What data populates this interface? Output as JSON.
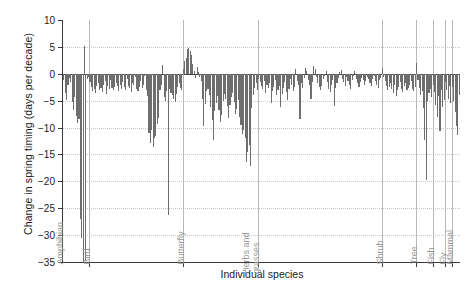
{
  "chart_data": {
    "type": "bar",
    "title": "",
    "xlabel": "Individual species",
    "ylabel": "Change in spring timing (days per decade)",
    "ylim": [
      -35,
      10
    ],
    "yticks": [
      10,
      5,
      0,
      -5,
      -10,
      -15,
      -20,
      -25,
      -30,
      -35
    ],
    "ytick_labels": [
      "10",
      "5",
      "0",
      "−5",
      "−10",
      "−15",
      "−20",
      "−25",
      "−30",
      "−35"
    ],
    "grid": "horizontal-dotted",
    "legend": "none",
    "bar_color": "#6e6e6e",
    "groups": [
      {
        "label": "Amphibian",
        "values": [
          -0.4,
          -1.2,
          -3.6,
          -4.8,
          -2.0,
          -0.8,
          -1.6,
          -5.2,
          -6.8,
          -4.4,
          -7.8,
          -9.2,
          -8.4,
          -27.0,
          -30.5,
          -35.0,
          5.2,
          -34.8,
          -1.0,
          -0.6
        ]
      },
      {
        "label": "Bird",
        "values": [
          -1.6,
          -2.4,
          -3.2,
          -2.8,
          -3.6,
          -2.2,
          -1.8,
          -3.0,
          -2.6,
          -3.4,
          -2.0,
          -1.4,
          -3.8,
          -2.2,
          -2.8,
          -1.2,
          -2.6,
          -3.0,
          -2.4,
          -1.8,
          -2.2,
          -3.2,
          -2.0,
          -2.8,
          -1.6,
          -2.4,
          -3.0,
          -1.0,
          -2.2,
          -2.6,
          -3.4,
          -1.8,
          -2.0,
          -0.6,
          -2.8,
          -3.2,
          -2.4,
          -1.4,
          -2.6,
          -2.0,
          -0.4,
          -3.0,
          -4.2,
          -11.0,
          -12.8,
          -10.4,
          -13.6,
          -12.0,
          -11.6,
          -9.4,
          -8.2,
          -3.0,
          -2.0,
          1.6,
          -4.4,
          -5.0,
          -3.2,
          -26.2,
          -2.8,
          -3.6,
          -4.0,
          -4.6,
          -5.2,
          -3.8,
          -2.4,
          -1.8,
          -2.6,
          -3.0
        ]
      },
      {
        "label": "Butterfly",
        "values": [
          0.8,
          2.4,
          3.0,
          4.6,
          4.8,
          4.2,
          3.4,
          1.8,
          0.6,
          -0.8,
          1.2,
          0.4,
          -0.6,
          -1.4,
          -4.6,
          -9.8,
          -5.6,
          -3.2,
          -2.8,
          -4.0,
          -6.2,
          -8.6,
          -12.4,
          -7.0,
          -5.4,
          -4.2,
          -6.8,
          -9.0,
          -7.6,
          -5.0,
          -3.8,
          -4.6,
          -6.0,
          -8.2,
          -5.8,
          -4.4,
          -3.6,
          -5.2,
          -7.4,
          -6.6,
          -4.8,
          -8.0,
          -9.6,
          -11.2,
          -10.4,
          -12.0,
          -16.4,
          -14.6,
          -13.2,
          -17.2,
          -6.4,
          -4.0,
          -2.6,
          -1.8,
          -3.0
        ]
      },
      {
        "label": "Herbs and grasses",
        "values": [
          -1.0,
          -1.6,
          -2.2,
          -2.8,
          -1.4,
          -3.6,
          -2.0,
          -2.6,
          -1.8,
          -5.4,
          -3.2,
          -2.4,
          -1.2,
          -4.0,
          -3.0,
          -2.2,
          -6.2,
          -3.8,
          -2.6,
          -1.6,
          -3.4,
          -4.8,
          -2.8,
          -1.0,
          -2.0,
          -3.2,
          -2.4,
          0.8,
          -1.4,
          -2.0,
          -8.4,
          -1.8,
          -2.6,
          -0.8,
          1.0,
          0.6,
          -1.2,
          -2.0,
          -4.6,
          -1.6,
          1.4,
          0.9,
          -0.6,
          -1.8,
          -2.4,
          -3.0,
          -2.2,
          -1.0,
          -0.4,
          0.5,
          -1.6,
          -2.8,
          -3.4,
          -2.0,
          -1.2,
          -6.0,
          -2.6,
          -1.8,
          -0.8,
          0.4,
          0.7,
          -1.0,
          -1.6,
          -2.2,
          -0.6,
          -1.4,
          -2.0,
          -2.8,
          -1.2,
          -0.5,
          0.6,
          -1.0,
          -1.8,
          -2.4,
          -1.6,
          -0.8,
          -1.2,
          -2.0,
          -1.4,
          -0.6,
          -1.0,
          -1.8,
          -2.2,
          -1.0,
          -0.4,
          -1.4,
          -2.0,
          -2.6,
          -1.2,
          -0.8
        ]
      },
      {
        "label": "Shrub",
        "values": [
          1.0,
          -0.6,
          -1.4,
          -2.2,
          -3.0,
          -2.4,
          -1.8,
          -2.8,
          -3.6,
          -2.0,
          -4.2,
          -3.0,
          -2.4,
          -1.6,
          -2.8,
          -3.4,
          -2.2,
          -1.8,
          -3.0,
          -2.6,
          -2.0,
          -1.4,
          -2.8,
          -3.2,
          -2.4
        ]
      },
      {
        "label": "Tree",
        "values": [
          2.0,
          -1.2,
          -2.6,
          -4.0,
          -3.2,
          -6.4,
          -12.4,
          -19.8,
          -5.0,
          -3.6,
          -2.8,
          -4.4
        ]
      },
      {
        "label": "Fish",
        "values": [
          -2.0,
          -3.4,
          -5.8,
          -8.0,
          -4.2,
          -10.6,
          -3.0,
          -6.2,
          -4.8
        ]
      },
      {
        "label": "Fly",
        "values": [
          -1.6,
          -3.0,
          -4.6,
          -2.2,
          -5.4
        ]
      },
      {
        "label": "Mammal",
        "values": [
          -2.4,
          -5.0,
          -7.2,
          -9.8,
          -11.4,
          -4.0
        ]
      }
    ]
  }
}
